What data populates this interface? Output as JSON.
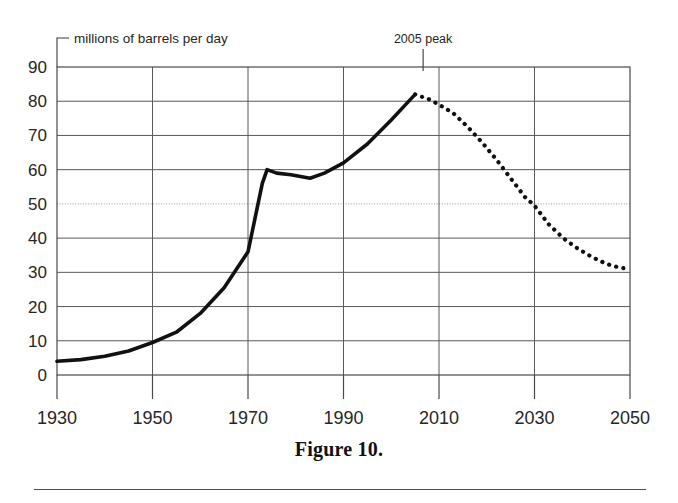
{
  "figure": {
    "caption": "Figure 10.",
    "unit_label": "millions of barrels per day"
  },
  "annotations": [
    {
      "name": "peak-annotation",
      "text": "2005 peak",
      "year": 2005,
      "value": 82
    }
  ],
  "chart_data": {
    "type": "line",
    "title": "",
    "xlabel": "",
    "ylabel": "millions of barrels per day",
    "xlim": [
      1930,
      2050
    ],
    "ylim": [
      0,
      90
    ],
    "xticks": [
      1930,
      1950,
      1970,
      1990,
      2010,
      2030,
      2050
    ],
    "yticks": [
      0,
      10,
      20,
      30,
      40,
      50,
      60,
      70,
      80,
      90
    ],
    "xtick_labels": [
      "1930",
      "1950",
      "1970",
      "1990",
      "2010",
      "2030",
      "2050"
    ],
    "ytick_labels": [
      "0",
      "10",
      "20",
      "30",
      "40",
      "50",
      "60",
      "70",
      "80",
      "90"
    ],
    "grid": true,
    "legend": false,
    "line_color": "#111111",
    "series": [
      {
        "name": "historical production",
        "style": "solid",
        "x": [
          1930,
          1935,
          1940,
          1945,
          1950,
          1955,
          1960,
          1965,
          1970,
          1973,
          1974,
          1976,
          1979,
          1983,
          1986,
          1990,
          1995,
          2000,
          2003,
          2005
        ],
        "values": [
          4,
          4.5,
          5.5,
          7,
          9.5,
          12.5,
          18,
          25.5,
          36,
          56,
          60,
          59,
          58.5,
          57.5,
          59,
          62,
          67.5,
          74.5,
          79,
          82
        ]
      },
      {
        "name": "projected decline",
        "style": "dotted",
        "x": [
          2005,
          2008,
          2010,
          2013,
          2016,
          2019,
          2022,
          2025,
          2028,
          2030,
          2033,
          2036,
          2039,
          2042,
          2045,
          2048,
          2050
        ],
        "values": [
          82,
          80.5,
          79,
          76.5,
          72.5,
          68,
          63,
          57.5,
          52,
          49.5,
          44,
          40,
          37,
          34.5,
          32.5,
          31.3,
          31
        ]
      }
    ]
  }
}
